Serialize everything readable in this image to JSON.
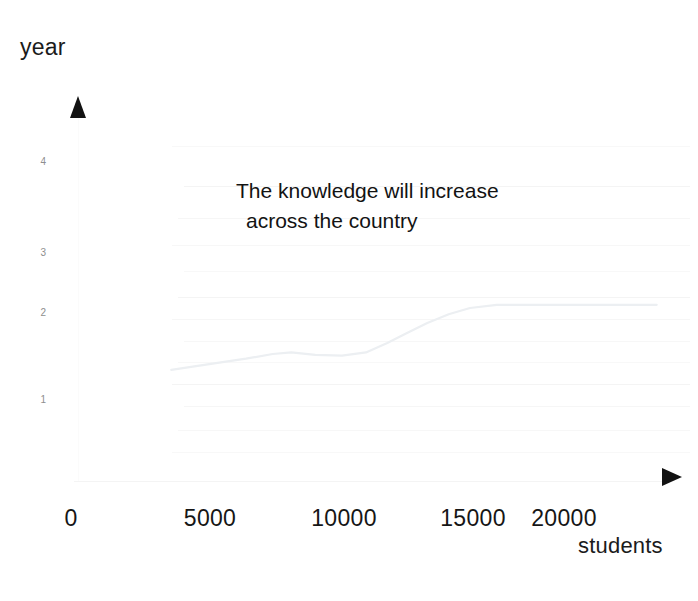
{
  "chart_data": {
    "type": "line",
    "title": "",
    "annotation": {
      "line1": "The knowledge will  increase",
      "line2": "across the country"
    },
    "xlabel": "students",
    "ylabel": "year",
    "xlim": [
      0,
      23000
    ],
    "ylim": [
      0,
      4.6
    ],
    "grid": true,
    "legend": "none",
    "x_ticks": [
      {
        "label": "0",
        "value": 0
      },
      {
        "label": "5000",
        "value": 5000
      },
      {
        "label": "10000",
        "value": 10000
      },
      {
        "label": "15000",
        "value": 15000
      },
      {
        "label": "20000",
        "value": 20000
      }
    ],
    "y_ticks": [
      {
        "label": "1",
        "value": 1
      },
      {
        "label": "2",
        "value": 2
      },
      {
        "label": "3",
        "value": 3
      },
      {
        "label": "4",
        "value": 4
      }
    ],
    "series": [
      {
        "name": "knowledge",
        "color": "#eceff2",
        "x": [
          3800,
          4600,
          5600,
          6600,
          7600,
          8300,
          9200,
          10200,
          11100,
          11900,
          12600,
          13400,
          14200,
          15000,
          16000,
          18000,
          20000,
          22000
        ],
        "y": [
          1.38,
          1.42,
          1.47,
          1.52,
          1.58,
          1.6,
          1.57,
          1.56,
          1.6,
          1.72,
          1.84,
          1.97,
          2.08,
          2.16,
          2.2,
          2.2,
          2.2,
          2.2
        ]
      }
    ],
    "gridlines_y": [
      0.35,
      0.62,
      0.92,
      1.2,
      1.48,
      1.75,
      2.02,
      2.3,
      2.62,
      2.95,
      3.3,
      3.7,
      4.2
    ],
    "colors": {
      "text": "#131313",
      "tick_text": "#161616",
      "y_tick_text": "#8e8e8e",
      "grid": "#f3f3f3",
      "axis": "#f4f4f4",
      "arrow": "#121212",
      "line": "#eceff2",
      "background": "#ffffff"
    }
  }
}
